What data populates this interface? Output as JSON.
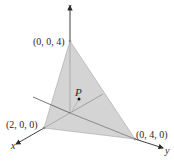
{
  "diagram": {
    "axes": {
      "x_label": "x",
      "y_label": "y",
      "z_label": "z"
    },
    "vertices": [
      {
        "id": "z-intercept",
        "label": "(0, 0, 4)"
      },
      {
        "id": "x-intercept",
        "label": "(2, 0, 0)"
      },
      {
        "id": "y-intercept",
        "label": "(0, 4, 0)"
      }
    ],
    "point": {
      "label": "P"
    },
    "colors": {
      "face": "#d4d4d4",
      "face_edge": "#9a9a9a",
      "axis": "#2a2a2a",
      "vertex_dot": "#8a8a8a"
    }
  }
}
